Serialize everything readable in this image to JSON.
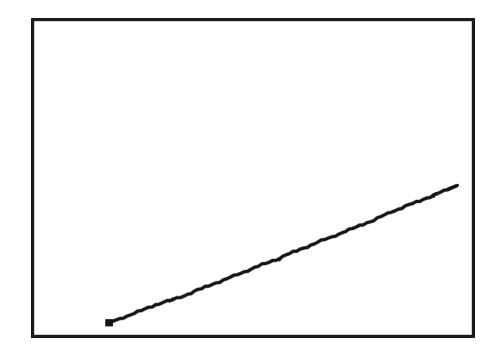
{
  "figure": {
    "title": "",
    "background_color": "#ffffff",
    "frame_color": "#1b1b1b",
    "line_color": "#161616",
    "width": 494,
    "height": 355,
    "caption": ""
  },
  "frame": {
    "left": 31,
    "top": 18,
    "right": 475,
    "bottom": 338,
    "stroke_width": 3.2
  },
  "chart_data": {
    "type": "line",
    "title": "",
    "subtitle": "",
    "xlabel": "",
    "ylabel": "",
    "grid": false,
    "legend": null,
    "legend_position": "none",
    "axis_tick_labels_x": [],
    "axis_tick_labels_y": [],
    "xlim": [
      0,
      100
    ],
    "ylim": [
      0,
      100
    ],
    "annotations": [],
    "style": "hand-drawn scanned single rising line, no axis labels or ticks",
    "series": [
      {
        "name": "series-1",
        "color": "#161616",
        "marker_start": "square",
        "marker_end": "hook",
        "x": [
          0,
          5,
          10,
          15,
          18,
          20,
          25,
          30,
          35,
          40,
          45,
          48,
          50,
          55,
          60,
          65,
          70,
          75,
          80,
          85,
          90,
          95,
          100
        ],
        "y": [
          0,
          3,
          6.5,
          10,
          12,
          13.5,
          17.5,
          21,
          24.5,
          28,
          32,
          34,
          35.5,
          39,
          43,
          47,
          51,
          55.5,
          60,
          65,
          73,
          80,
          84
        ],
        "values_pixel": [
          [
            109,
            323
          ],
          [
            127,
            316
          ],
          [
            145,
            309
          ],
          [
            163,
            302
          ],
          [
            172,
            300
          ],
          [
            181,
            297
          ],
          [
            198,
            290
          ],
          [
            216,
            283
          ],
          [
            234,
            276
          ],
          [
            251,
            269
          ],
          [
            269,
            262
          ],
          [
            280,
            258
          ],
          [
            286,
            255
          ],
          [
            304,
            248
          ],
          [
            321,
            241
          ],
          [
            339,
            234
          ],
          [
            356,
            227
          ],
          [
            374,
            220
          ],
          [
            391,
            212
          ],
          [
            409,
            205
          ],
          [
            427,
            198
          ],
          [
            444,
            191
          ],
          [
            456,
            186
          ]
        ]
      }
    ]
  },
  "accessibility": {
    "summary": "A rectangular plot frame containing one nearly straight line rising from lower left to upper right. No axis labels, tick marks, gridlines, legend or text are present."
  }
}
